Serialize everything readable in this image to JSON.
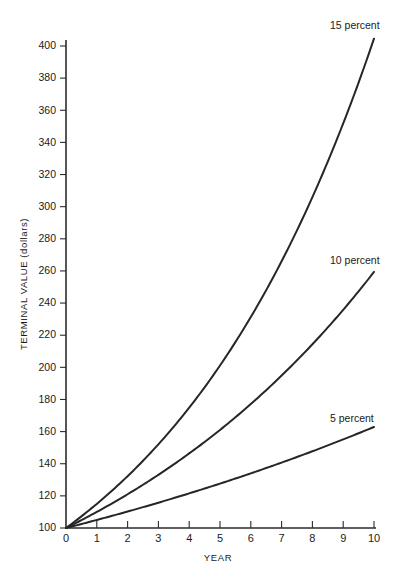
{
  "chart_data": {
    "type": "line",
    "title": "",
    "xlabel": "YEAR",
    "ylabel": "TERMINAL VALUE (dollars)",
    "xlim": [
      0,
      10
    ],
    "ylim": [
      100,
      410
    ],
    "grid": false,
    "legend_position": "inline-end-of-line",
    "x": [
      0,
      1,
      2,
      3,
      4,
      5,
      6,
      7,
      8,
      9,
      10
    ],
    "xticks": [
      "0",
      "1",
      "2",
      "3",
      "4",
      "5",
      "6",
      "7",
      "8",
      "9",
      "10"
    ],
    "yticks": [
      "100",
      "120",
      "140",
      "160",
      "180",
      "200",
      "220",
      "240",
      "260",
      "280",
      "300",
      "320",
      "340",
      "360",
      "380",
      "400"
    ],
    "series": [
      {
        "name": "5 percent",
        "label": "5 percent",
        "rate": 0.05,
        "color": "#262626",
        "values": [
          100,
          105,
          110.3,
          115.8,
          121.6,
          127.6,
          134.0,
          140.7,
          147.7,
          155.1,
          162.9
        ],
        "label_x": 10,
        "label_y": 168
      },
      {
        "name": "10 percent",
        "label": "10 percent",
        "rate": 0.1,
        "color": "#262626",
        "values": [
          100,
          110,
          121,
          133.1,
          146.4,
          161.1,
          177.2,
          194.9,
          214.4,
          235.8,
          259.4
        ],
        "label_x": 10,
        "label_y": 266
      },
      {
        "name": "15 percent",
        "label": "15 percent",
        "rate": 0.15,
        "color": "#262626",
        "values": [
          100,
          115,
          132.3,
          152.1,
          174.9,
          201.1,
          231.3,
          266.0,
          305.9,
          351.8,
          404.6
        ],
        "label_x": 10,
        "label_y": 412
      }
    ]
  },
  "figure": {
    "background_color": "#ffffff",
    "axis_color": "#2b2b2b",
    "line_color": "#262626"
  }
}
